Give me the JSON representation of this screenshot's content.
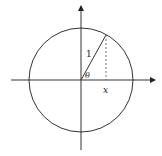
{
  "diagram": {
    "colors": {
      "stroke": "#333333",
      "dashed": "#777777",
      "background": "#ffffff"
    },
    "center": {
      "x": 81,
      "y": 80
    },
    "radius": 52,
    "axes": {
      "x": {
        "from": 11,
        "to": 155
      },
      "y": {
        "from": 6,
        "to": 150
      }
    },
    "radius_endpoint": {
      "x": 106,
      "y": 35
    },
    "labels": {
      "radius": "1",
      "angle": "θ",
      "x_projection": "x"
    }
  }
}
